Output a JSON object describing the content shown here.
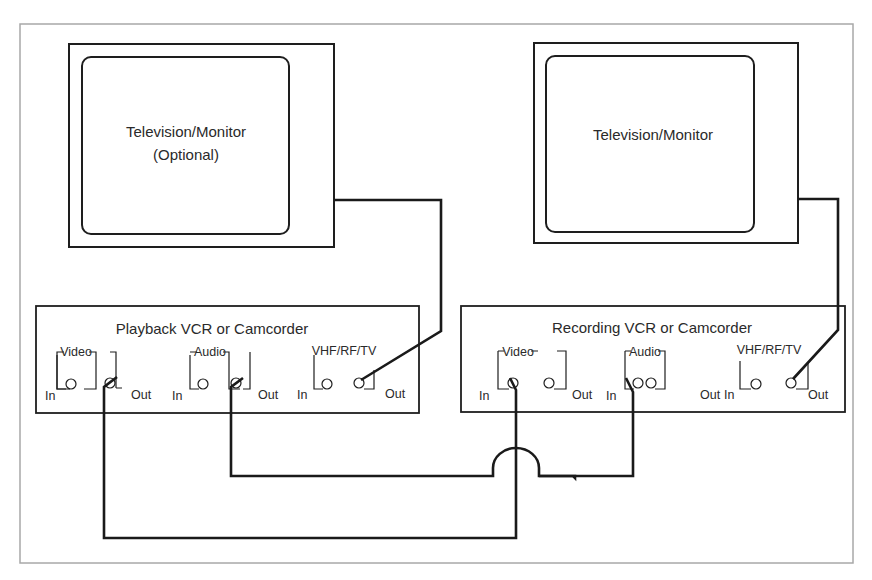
{
  "diagram": {
    "colors": {
      "frame": "#a8a8a8",
      "ink": "#1e1e1e",
      "background": "#ffffff"
    },
    "televisions": [
      {
        "id": "tv-left",
        "line1": "Television/Monitor",
        "line2": "(Optional)"
      },
      {
        "id": "tv-right",
        "line1": "Television/Monitor",
        "line2": ""
      }
    ],
    "vcrs": [
      {
        "id": "playback",
        "title": "Playback VCR or Camcorder",
        "groups": [
          {
            "name": "Video",
            "in": "In",
            "out": "Out"
          },
          {
            "name": "Audio",
            "in": "In",
            "out": "Out"
          },
          {
            "name": "VHF/RF/TV",
            "in": "In",
            "out": "Out"
          }
        ]
      },
      {
        "id": "recording",
        "title": "Recording VCR or Camcorder",
        "groups": [
          {
            "name": "Video",
            "in": "In",
            "out": "Out"
          },
          {
            "name": "Audio",
            "in": "In",
            "out": "Out"
          },
          {
            "name": "VHF/RF/TV",
            "in": "In",
            "out": "Out"
          }
        ]
      }
    ],
    "connections": [
      {
        "from": "Playback VCR Video Out",
        "to": "Recording VCR Video In"
      },
      {
        "from": "Playback VCR Audio Out",
        "to": "Recording VCR Audio In"
      },
      {
        "from": "Playback VCR VHF/RF/TV Out",
        "to": "Television/Monitor (Optional)"
      },
      {
        "from": "Recording VCR VHF/RF/TV Out",
        "to": "Television/Monitor"
      }
    ]
  }
}
